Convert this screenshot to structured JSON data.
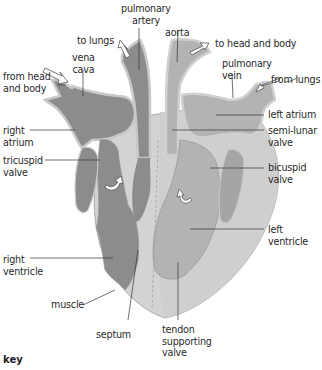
{
  "diagram": {
    "colors": {
      "deoxygenated_blood": "#8c8c8c",
      "oxygenated_blood": "#b3b3b3",
      "muscle_wall": "#d3d3d3",
      "outline": "#7a7a7a",
      "label_text": "#2a2a2a",
      "background": "#ffffff"
    },
    "labels": {
      "pulmonary_artery": "pulmonary\nartery",
      "aorta": "aorta",
      "to_lungs": "to lungs",
      "to_head_and_body": "to head and body",
      "vena_cava": "vena\ncava",
      "pulmonary_vein": "pulmonary\nvein",
      "from_head_and_body": "from head\nand body",
      "from_lungs": "from lungs",
      "left_atrium": "left atrium",
      "right_atrium": "right\natrium",
      "semi_lunar_valve": "semi-lunar\nvalve",
      "tricuspid_valve": "tricuspid\nvalve",
      "bicuspid_valve": "bicuspid\nvalve",
      "left_ventricle": "left\nventricle",
      "right_ventricle": "right\nventricle",
      "muscle": "muscle",
      "septum": "septum",
      "tendon_supporting_valve": "tendon\nsupporting\nvalve"
    },
    "key_label": "key"
  }
}
